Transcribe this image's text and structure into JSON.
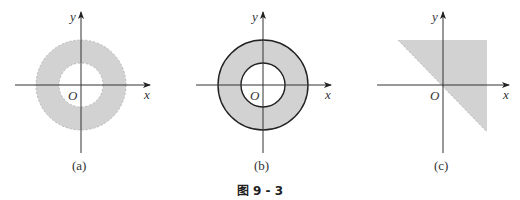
{
  "figure": {
    "caption": "图 9 - 3",
    "fill_color": "#d2d2d2",
    "panels": [
      {
        "id": "a",
        "sublabel": "(a)",
        "x_label": "x",
        "y_label": "y",
        "origin_label": "O",
        "shape": "annulus",
        "boundary": "dashed",
        "outer_radius": 45,
        "inner_radius": 22
      },
      {
        "id": "b",
        "sublabel": "(b)",
        "x_label": "x",
        "y_label": "y",
        "origin_label": "O",
        "shape": "annulus",
        "boundary": "solid",
        "outer_radius": 45,
        "inner_radius": 22
      },
      {
        "id": "c",
        "sublabel": "(c)",
        "x_label": "x",
        "y_label": "y",
        "origin_label": "O",
        "shape": "half-plane triangle region above line y = -x",
        "boundary": "dashed"
      }
    ]
  }
}
